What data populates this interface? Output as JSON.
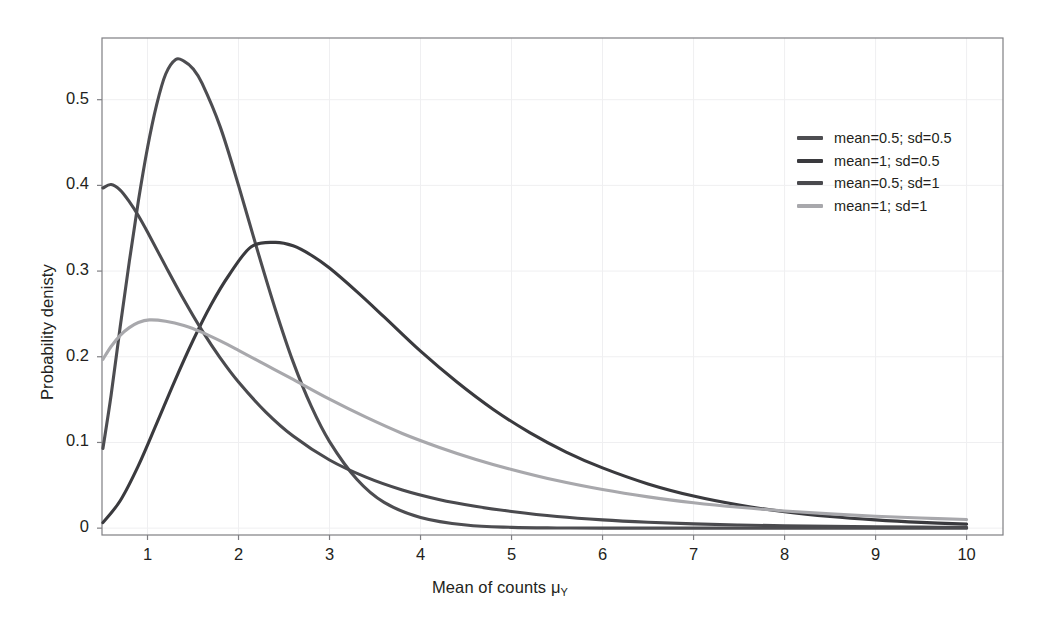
{
  "chart_data": {
    "type": "line",
    "title": "",
    "xlabel": "Mean of counts μ",
    "xlabel_sub": "Y",
    "ylabel": "Probability denisty",
    "xlim": [
      0.5,
      10.4
    ],
    "ylim": [
      -0.008,
      0.572
    ],
    "xticks": [
      1,
      2,
      3,
      4,
      5,
      6,
      7,
      8,
      9,
      10
    ],
    "xtick_labels": [
      "1",
      "2",
      "3",
      "4",
      "5",
      "6",
      "7",
      "8",
      "9",
      "10"
    ],
    "yticks": [
      0,
      0.1,
      0.2,
      0.3,
      0.4,
      0.5
    ],
    "ytick_labels": [
      "0",
      "0.1",
      "0.2",
      "0.3",
      "0.4",
      "0.5"
    ],
    "grid": true,
    "grid_color": "#efeff1",
    "panel_background": "#ffffff",
    "panel_border_color": "#7f7f83",
    "legend_position": "top-right inside",
    "series": [
      {
        "name": "mean=0.5; sd=0.5",
        "color": "#4d4d51",
        "shape": "gamma",
        "shape_k": 4.0,
        "scale": 0.45,
        "peak_x": 1.31,
        "peak_y": 0.547,
        "x": [
          0.51,
          0.6,
          0.7,
          0.8,
          0.9,
          1.0,
          1.1,
          1.2,
          1.31,
          1.4,
          1.5,
          1.6,
          1.8,
          2.0,
          2.2,
          2.4,
          2.6,
          2.8,
          3.0,
          3.3,
          3.6,
          4.0,
          4.5,
          5.0,
          5.5,
          6.0,
          7.0,
          8.0,
          9.0,
          10.0
        ],
        "y": [
          0.093,
          0.155,
          0.235,
          0.311,
          0.382,
          0.444,
          0.494,
          0.53,
          0.547,
          0.545,
          0.536,
          0.519,
          0.468,
          0.4,
          0.327,
          0.257,
          0.194,
          0.142,
          0.101,
          0.057,
          0.03,
          0.0125,
          0.0036,
          0.00094,
          0.00023,
          6e-05,
          4e-06,
          2e-07,
          1e-08,
          1e-09
        ]
      },
      {
        "name": "mean=1; sd=0.5",
        "color": "#3a3a3e",
        "shape": "gamma",
        "shape_k": 2.0,
        "scale": 1.08,
        "peak_x": 2.14,
        "peak_y": 0.335,
        "x": [
          0.51,
          0.7,
          0.9,
          1.1,
          1.3,
          1.5,
          1.7,
          1.9,
          2.14,
          2.4,
          2.6,
          2.8,
          3.0,
          3.3,
          3.6,
          4.0,
          4.4,
          4.8,
          5.2,
          5.6,
          6.0,
          6.5,
          7.0,
          7.5,
          8.0,
          8.5,
          9.0,
          9.5,
          10.0
        ],
        "y": [
          0.0064,
          0.032,
          0.073,
          0.122,
          0.172,
          0.219,
          0.261,
          0.296,
          0.3285,
          0.3335,
          0.3295,
          0.3185,
          0.3035,
          0.276,
          0.2465,
          0.2065,
          0.1705,
          0.1385,
          0.1115,
          0.0888,
          0.0703,
          0.0516,
          0.0374,
          0.0269,
          0.0192,
          0.0136,
          0.0096,
          0.0067,
          0.0047
        ]
      },
      {
        "name": "mean=0.5; sd=1",
        "color": "#4a4a4e",
        "shape": "gamma",
        "shape_k": 1.28,
        "scale": 0.7,
        "peak_x": 0.6,
        "peak_y": 0.401,
        "x": [
          0.51,
          0.6,
          0.7,
          0.8,
          0.9,
          1.0,
          1.2,
          1.4,
          1.6,
          1.8,
          2.0,
          2.3,
          2.6,
          3.0,
          3.4,
          3.8,
          4.2,
          4.6,
          5.0,
          5.5,
          6.0,
          6.5,
          7.0,
          7.5,
          8.0,
          8.5,
          9.0,
          9.5,
          10.0
        ],
        "y": [
          0.397,
          0.401,
          0.3945,
          0.381,
          0.3645,
          0.3455,
          0.3055,
          0.2665,
          0.2305,
          0.1985,
          0.1705,
          0.1355,
          0.1075,
          0.0795,
          0.0595,
          0.0445,
          0.0335,
          0.0255,
          0.0195,
          0.0136,
          0.0096,
          0.0069,
          0.005,
          0.0037,
          0.0027,
          0.0021,
          0.0016,
          0.0012,
          0.001
        ]
      },
      {
        "name": "mean=1; sd=1",
        "color": "#a8a8ac",
        "shape": "gamma",
        "shape_k": 1.6,
        "scale": 1.3,
        "peak_x": 1.02,
        "peak_y": 0.243,
        "x": [
          0.51,
          0.6,
          0.7,
          0.8,
          0.9,
          1.02,
          1.2,
          1.4,
          1.6,
          1.8,
          2.0,
          2.3,
          2.6,
          3.0,
          3.4,
          3.8,
          4.2,
          4.6,
          5.0,
          5.5,
          6.0,
          6.5,
          7.0,
          7.5,
          8.0,
          8.5,
          9.0,
          9.5,
          10.0
        ],
        "y": [
          0.197,
          0.212,
          0.225,
          0.234,
          0.24,
          0.243,
          0.2415,
          0.2365,
          0.2285,
          0.2185,
          0.2075,
          0.1905,
          0.1735,
          0.1505,
          0.1295,
          0.1105,
          0.0945,
          0.0805,
          0.0685,
          0.0555,
          0.045,
          0.0365,
          0.0297,
          0.0243,
          0.02,
          0.0166,
          0.0139,
          0.0118,
          0.0101
        ]
      }
    ]
  },
  "legend": {
    "items": [
      {
        "label": "mean=0.5; sd=0.5",
        "color": "#4d4d51"
      },
      {
        "label": "mean=1; sd=0.5",
        "color": "#3a3a3e"
      },
      {
        "label": "mean=0.5; sd=1",
        "color": "#4a4a4e"
      },
      {
        "label": "mean=1; sd=1",
        "color": "#a8a8ac"
      }
    ]
  },
  "axes": {
    "x_label_main": "Mean of counts μ",
    "x_label_subscript": "Y",
    "y_label": "Probability denisty"
  }
}
